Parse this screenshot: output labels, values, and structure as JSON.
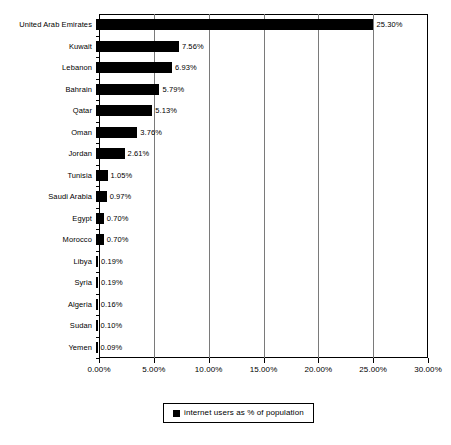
{
  "chart_data": {
    "type": "bar",
    "orientation": "horizontal",
    "title": "",
    "xlabel": "",
    "ylabel": "",
    "xlim": [
      0,
      30
    ],
    "xticks": [
      "0.00%",
      "5.00%",
      "10.00%",
      "15.00%",
      "20.00%",
      "25.00%",
      "30.00%"
    ],
    "xtick_values": [
      0,
      5,
      10,
      15,
      20,
      25,
      30
    ],
    "grid": true,
    "grid_axis": "x",
    "legend_position": "bottom",
    "legend": [
      "internet users as % of population"
    ],
    "series_name": "internet users as % of population",
    "bar_color": "#000000",
    "categories": [
      "United Arab Emirates",
      "Kuwait",
      "Lebanon",
      "Bahrain",
      "Qatar",
      "Oman",
      "Jordan",
      "Tunisia",
      "Saudi Arabia",
      "Egypt",
      "Morocco",
      "Libya",
      "Syria",
      "Algeria",
      "Sudan",
      "Yemen"
    ],
    "values": [
      25.3,
      7.56,
      6.93,
      5.79,
      5.13,
      3.76,
      2.61,
      1.05,
      0.97,
      0.7,
      0.7,
      0.19,
      0.19,
      0.16,
      0.1,
      0.09
    ],
    "data_labels": [
      "25.30%",
      "7.56%",
      "6.93%",
      "5.79%",
      "5.13%",
      "3.76%",
      "2.61%",
      "1.05%",
      "0.97%",
      "0.70%",
      "0.70%",
      "0.19%",
      "0.19%",
      "0.16%",
      "0.10%",
      "0.09%"
    ]
  }
}
